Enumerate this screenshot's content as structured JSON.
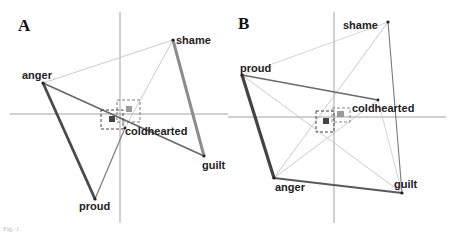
{
  "figure": {
    "caption": "Fig. 1",
    "colors": {
      "axis": "#8a8a8a",
      "thin_edge": "#c4c4c4",
      "mid_edge": "#7a7a7a",
      "thick_edge_dark": "#4a4a4a",
      "thick_edge_light": "#8c8c8c",
      "label": "#222222",
      "marker_dark": "#444444",
      "marker_grey": "#9a9a9a"
    }
  },
  "panels": [
    {
      "id": "A",
      "letter": "A",
      "nodes": [
        {
          "label": "shame",
          "x": 173,
          "y": 40
        },
        {
          "label": "anger",
          "x": 43,
          "y": 83
        },
        {
          "label": "coldhearted",
          "x": 125,
          "y": 128
        },
        {
          "label": "guilt",
          "x": 204,
          "y": 156
        },
        {
          "label": "proud",
          "x": 95,
          "y": 199
        }
      ]
    },
    {
      "id": "B",
      "letter": "B",
      "nodes": [
        {
          "label": "shame",
          "x": 388,
          "y": 22
        },
        {
          "label": "proud",
          "x": 242,
          "y": 75
        },
        {
          "label": "coldhearted",
          "x": 378,
          "y": 100
        },
        {
          "label": "anger",
          "x": 274,
          "y": 178
        },
        {
          "label": "guilt",
          "x": 402,
          "y": 193
        }
      ]
    }
  ]
}
